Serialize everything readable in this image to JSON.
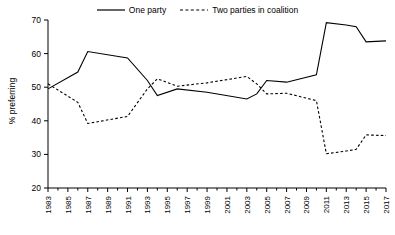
{
  "chart_data": {
    "type": "line",
    "title": "",
    "subtitle": "",
    "xlabel": "",
    "ylabel": "% preferring",
    "xlim": [
      1983,
      2017
    ],
    "ylim": [
      20,
      70
    ],
    "grid": false,
    "legend_position": "top-center",
    "x": [
      1983,
      1986,
      1987,
      1991,
      1993,
      1994,
      1996,
      1999,
      2003,
      2004,
      2005,
      2007,
      2010,
      2011,
      2013,
      2014,
      2015,
      2017
    ],
    "xticks": [
      "1983",
      "1985",
      "1987",
      "1989",
      "1991",
      "1993",
      "1995",
      "1997",
      "1999",
      "2001",
      "2003",
      "2005",
      "2007",
      "2009",
      "2011",
      "2013",
      "2015",
      "2017"
    ],
    "yticks": [
      "20",
      "30",
      "40",
      "50",
      "60",
      "70"
    ],
    "series": [
      {
        "name": "One party",
        "style": "solid",
        "color": "#000000",
        "values": [
          49.5,
          54.5,
          60.6,
          58.7,
          52.0,
          47.5,
          49.5,
          48.5,
          46.5,
          48.0,
          52.0,
          51.5,
          53.7,
          69.2,
          68.5,
          68.0,
          63.5,
          63.8
        ]
      },
      {
        "name": "Two parties in coalition",
        "style": "dashed",
        "color": "#000000",
        "values": [
          51.0,
          45.5,
          39.2,
          41.3,
          49.5,
          52.5,
          50.3,
          51.3,
          53.2,
          51.0,
          48.0,
          48.2,
          46.0,
          30.2,
          31.0,
          31.5,
          35.8,
          35.6
        ]
      }
    ]
  },
  "legend": {
    "entries": [
      {
        "label": "One party",
        "style": "solid"
      },
      {
        "label": "Two parties in coalition",
        "style": "dashed"
      }
    ]
  },
  "axes": {
    "y_axis_label": "% preferring"
  }
}
